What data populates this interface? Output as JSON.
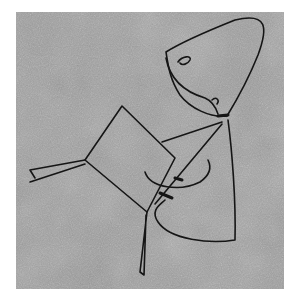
{
  "image": {
    "subject": "line drawing of a figure with a cone-shaped head holding a tilted square object, on a grainy gray textured surface",
    "colors": {
      "background": "#ffffff",
      "surface": "#9a9a9a",
      "ink": "#151515"
    }
  }
}
